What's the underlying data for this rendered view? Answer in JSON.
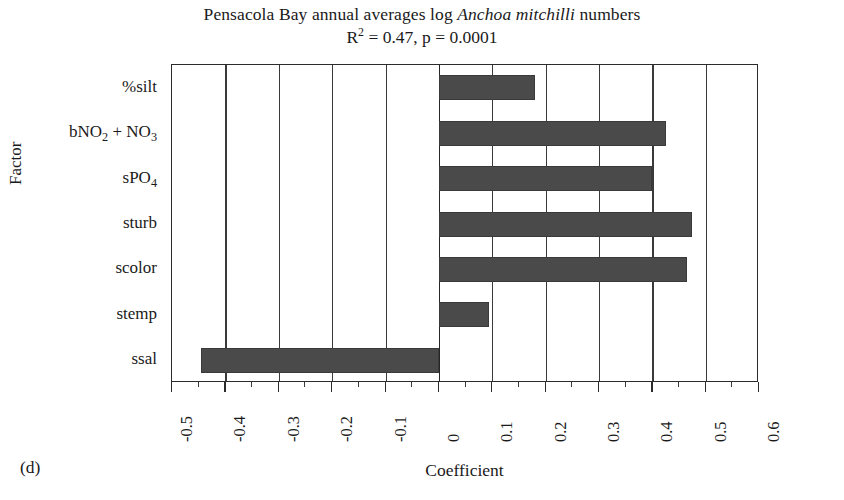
{
  "figure": {
    "panel_label": "(d)",
    "title_prefix": "Pensacola Bay annual averages log ",
    "title_species": "Anchoa mitchilli",
    "title_suffix": " numbers",
    "subtitle_r": "R",
    "subtitle_r_exp": "2",
    "subtitle_rest": " = 0.47, p = 0.0001",
    "bar_color": "#4a4a4a",
    "axis_color": "#2b2b2b",
    "background": "#ffffff"
  },
  "chart_data": {
    "type": "bar",
    "orientation": "horizontal",
    "title": "Pensacola Bay annual averages log Anchoa mitchilli numbers",
    "subtitle": "R2 = 0.47, p = 0.0001",
    "xlabel": "Coefficient",
    "ylabel": "Factor",
    "xlim": [
      -0.5,
      0.6
    ],
    "grid": true,
    "legend": "none",
    "categories": [
      "%silt",
      "bNO2 + NO3",
      "sPO4",
      "sturb",
      "scolor",
      "stemp",
      "ssal"
    ],
    "category_labels": [
      {
        "text": "%silt",
        "base": "%silt",
        "sub": "",
        "tail": ""
      },
      {
        "text": "bNO2 + NO3",
        "base": "bNO",
        "sub": "2",
        "tail": " + NO",
        "sub2": "3"
      },
      {
        "text": "sPO4",
        "base": "sPO",
        "sub": "4",
        "tail": ""
      },
      {
        "text": "sturb",
        "base": "sturb",
        "sub": "",
        "tail": ""
      },
      {
        "text": "scolor",
        "base": "scolor",
        "sub": "",
        "tail": ""
      },
      {
        "text": "stemp",
        "base": "stemp",
        "sub": "",
        "tail": ""
      },
      {
        "text": "ssal",
        "base": "ssal",
        "sub": "",
        "tail": ""
      }
    ],
    "values": [
      0.18,
      0.425,
      0.4,
      0.475,
      0.465,
      0.095,
      -0.445
    ],
    "xticks": [
      -0.5,
      -0.4,
      -0.3,
      -0.2,
      -0.1,
      0,
      0.1,
      0.2,
      0.3,
      0.4,
      0.5,
      0.6
    ],
    "xticklabels": [
      "-0.5",
      "-0.4",
      "-0.3",
      "-0.2",
      "-0.1",
      "0",
      "0.1",
      "0.2",
      "0.3",
      "0.4",
      "0.5",
      "0.6"
    ]
  }
}
